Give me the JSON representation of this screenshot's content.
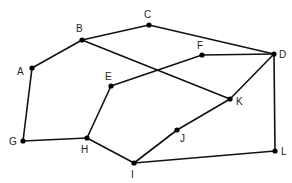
{
  "diagram": {
    "type": "graph",
    "nodes": [
      {
        "id": "A",
        "label": "A",
        "x": 32,
        "y": 68,
        "lx": 17,
        "ly": 75
      },
      {
        "id": "B",
        "label": "B",
        "x": 82,
        "y": 40,
        "lx": 76,
        "ly": 32
      },
      {
        "id": "C",
        "label": "C",
        "x": 149,
        "y": 25,
        "lx": 144,
        "ly": 18
      },
      {
        "id": "D",
        "label": "D",
        "x": 274,
        "y": 54,
        "lx": 279,
        "ly": 58
      },
      {
        "id": "E",
        "label": "E",
        "x": 111,
        "y": 86,
        "lx": 105,
        "ly": 80
      },
      {
        "id": "F",
        "label": "F",
        "x": 202,
        "y": 55,
        "lx": 197,
        "ly": 49
      },
      {
        "id": "G",
        "label": "G",
        "x": 23,
        "y": 141,
        "lx": 9,
        "ly": 145
      },
      {
        "id": "H",
        "label": "H",
        "x": 87,
        "y": 138,
        "lx": 81,
        "ly": 153
      },
      {
        "id": "I",
        "label": "I",
        "x": 134,
        "y": 163,
        "lx": 131,
        "ly": 178
      },
      {
        "id": "J",
        "label": "J",
        "x": 177,
        "y": 130,
        "lx": 180,
        "ly": 142
      },
      {
        "id": "K",
        "label": "K",
        "x": 230,
        "y": 99,
        "lx": 236,
        "ly": 105
      },
      {
        "id": "L",
        "label": "L",
        "x": 275,
        "y": 151,
        "lx": 281,
        "ly": 155
      }
    ],
    "edges": [
      [
        "A",
        "B"
      ],
      [
        "B",
        "C"
      ],
      [
        "C",
        "D"
      ],
      [
        "B",
        "K"
      ],
      [
        "E",
        "F"
      ],
      [
        "F",
        "D"
      ],
      [
        "D",
        "K"
      ],
      [
        "D",
        "L"
      ],
      [
        "A",
        "G"
      ],
      [
        "G",
        "H"
      ],
      [
        "H",
        "E"
      ],
      [
        "H",
        "I"
      ],
      [
        "I",
        "J"
      ],
      [
        "J",
        "K"
      ],
      [
        "I",
        "L"
      ]
    ]
  }
}
